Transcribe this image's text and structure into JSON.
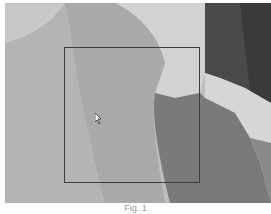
{
  "image": {
    "description": "grayscale abstract shapes photo",
    "colors": {
      "background_light": "#c9c9c9",
      "mid_gray": "#a8a8a8",
      "dark_gray": "#6e6e6e",
      "darkest": "#3f3f3f",
      "highlight": "#dcdcdc",
      "selection_border": "#3e3e3e"
    }
  },
  "selection_box": {
    "x": 64,
    "y": 47,
    "width": 136,
    "height": 136
  },
  "cursor": {
    "icon": "arrow-cursor",
    "x": 95,
    "y": 110
  },
  "caption": {
    "text": "Fig. 1"
  }
}
